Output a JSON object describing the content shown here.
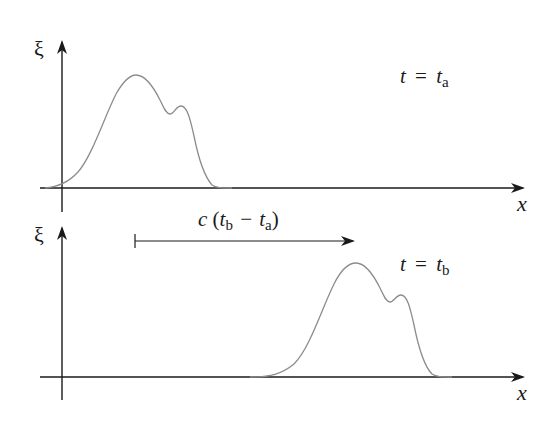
{
  "diagram": {
    "top_panel": {
      "y_axis_label": "ξ",
      "x_axis_label": "x",
      "time_label": {
        "lhs": "t",
        "eq": "=",
        "rhs": "t",
        "sub": "a"
      }
    },
    "bottom_panel": {
      "y_axis_label": "ξ",
      "x_axis_label": "x",
      "time_label": {
        "lhs": "t",
        "eq": "=",
        "rhs": "t",
        "sub": "b"
      }
    },
    "shift_arrow": {
      "label": {
        "c": "c",
        "open": "(",
        "t1": "t",
        "sub1": "b",
        "minus": "−",
        "t2": "t",
        "sub2": "a",
        "close": ")"
      }
    },
    "colors": {
      "axis": "#1a1a1a",
      "curve": "#8c8c8c",
      "text": "#1a1a1a"
    }
  }
}
